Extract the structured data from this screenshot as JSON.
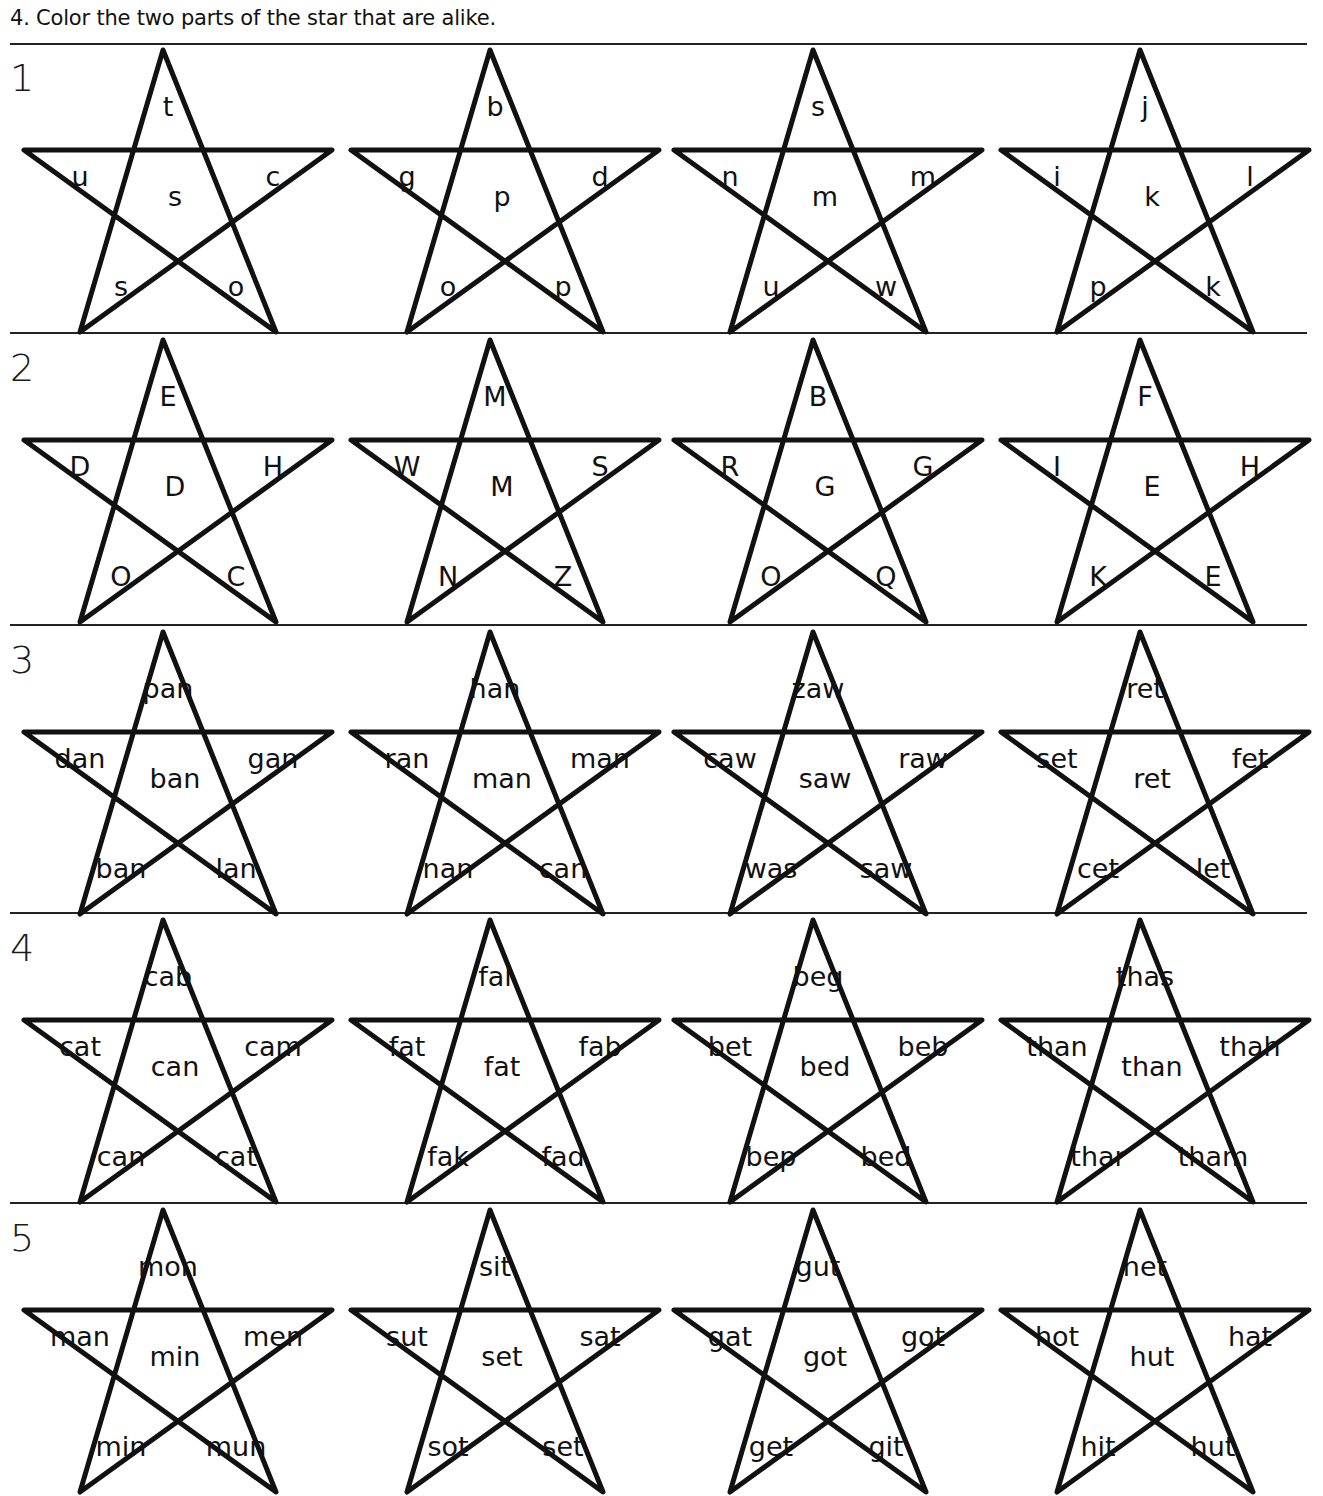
{
  "instruction": "4.  Color the two parts of the star that are alike.",
  "rows": [
    {
      "number": "1",
      "stars": [
        {
          "top": "t",
          "left": "u",
          "center": "s",
          "right": "c",
          "bottom_left": "s",
          "bottom_right": "o"
        },
        {
          "top": "b",
          "left": "g",
          "center": "p",
          "right": "d",
          "bottom_left": "o",
          "bottom_right": "p"
        },
        {
          "top": "s",
          "left": "n",
          "center": "m",
          "right": "m",
          "bottom_left": "u",
          "bottom_right": "w"
        },
        {
          "top": "j",
          "left": "i",
          "center": "k",
          "right": "l",
          "bottom_left": "p",
          "bottom_right": "k"
        }
      ]
    },
    {
      "number": "2",
      "stars": [
        {
          "top": "E",
          "left": "D",
          "center": "D",
          "right": "H",
          "bottom_left": "O",
          "bottom_right": "C"
        },
        {
          "top": "M",
          "left": "W",
          "center": "M",
          "right": "S",
          "bottom_left": "N",
          "bottom_right": "Z"
        },
        {
          "top": "B",
          "left": "R",
          "center": "G",
          "right": "G",
          "bottom_left": "O",
          "bottom_right": "Q"
        },
        {
          "top": "F",
          "left": "I",
          "center": "E",
          "right": "H",
          "bottom_left": "K",
          "bottom_right": "E"
        }
      ]
    },
    {
      "number": "3",
      "stars": [
        {
          "top": "pan",
          "left": "dan",
          "center": "ban",
          "right": "gan",
          "bottom_left": "ban",
          "bottom_right": "lan"
        },
        {
          "top": "han",
          "left": "ran",
          "center": "man",
          "right": "man",
          "bottom_left": "nan",
          "bottom_right": "can"
        },
        {
          "top": "zaw",
          "left": "caw",
          "center": "saw",
          "right": "raw",
          "bottom_left": "was",
          "bottom_right": "saw"
        },
        {
          "top": "ret",
          "left": "set",
          "center": "ret",
          "right": "fet",
          "bottom_left": "cet",
          "bottom_right": "let"
        }
      ]
    },
    {
      "number": "4",
      "stars": [
        {
          "top": "cab",
          "left": "cat",
          "center": "can",
          "right": "cam",
          "bottom_left": "can",
          "bottom_right": "cat"
        },
        {
          "top": "fal",
          "left": "fat",
          "center": "fat",
          "right": "fab",
          "bottom_left": "fak",
          "bottom_right": "fad"
        },
        {
          "top": "beg",
          "left": "bet",
          "center": "bed",
          "right": "beb",
          "bottom_left": "bep",
          "bottom_right": "bed"
        },
        {
          "top": "thas",
          "left": "than",
          "center": "than",
          "right": "thah",
          "bottom_left": "thar",
          "bottom_right": "tham"
        }
      ]
    },
    {
      "number": "5",
      "stars": [
        {
          "top": "mon",
          "left": "man",
          "center": "min",
          "right": "men",
          "bottom_left": "min",
          "bottom_right": "mun"
        },
        {
          "top": "sit",
          "left": "sut",
          "center": "set",
          "right": "sat",
          "bottom_left": "sot",
          "bottom_right": "set"
        },
        {
          "top": "gut",
          "left": "gat",
          "center": "got",
          "right": "got",
          "bottom_left": "get",
          "bottom_right": "git"
        },
        {
          "top": "het",
          "left": "hot",
          "center": "hut",
          "right": "hat",
          "bottom_left": "hit",
          "bottom_right": "hut"
        }
      ]
    }
  ],
  "colors": {
    "ink": "#111111",
    "paper": "#ffffff"
  }
}
